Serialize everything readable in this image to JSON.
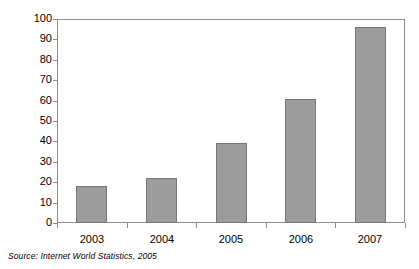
{
  "chart_data": {
    "type": "bar",
    "title": "",
    "subtitle": "",
    "xlabel": "",
    "ylabel": "",
    "categories": [
      "2003",
      "2004",
      "2005",
      "2006",
      "2007"
    ],
    "values": [
      18,
      22,
      39,
      61,
      96
    ],
    "series": [
      {
        "name": "",
        "values": [
          18,
          22,
          39,
          61,
          96
        ]
      }
    ],
    "ylim": [
      0,
      100
    ],
    "y_ticks": [
      0,
      10,
      20,
      30,
      40,
      50,
      60,
      70,
      80,
      90,
      100
    ],
    "y_tick_labels": [
      "0",
      "10",
      "20",
      "30",
      "40",
      "50",
      "60",
      "70",
      "80",
      "90",
      "100"
    ],
    "grid": false,
    "legend": false,
    "legend_position": "none",
    "bar_color": "#9c9c9c",
    "bar_edge_color": "#777777",
    "axis_color": "#8d8d8d",
    "background_color": "#ffffff",
    "annotations": []
  },
  "footer": {
    "source_note": "Source:  Internet World Statistics, 2005"
  }
}
